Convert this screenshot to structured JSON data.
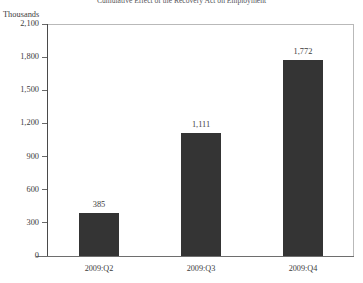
{
  "chart_data": {
    "type": "bar",
    "title": "Cumulative Effect of the Recovery Act on Employment",
    "categories": [
      "2009:Q2",
      "2009:Q3",
      "2009:Q4"
    ],
    "values": [
      385,
      1111,
      1772
    ],
    "value_labels": [
      "385",
      "1,111",
      "1,772"
    ],
    "xlabel": "",
    "ylabel": "Thousands",
    "ylim": [
      0,
      2100
    ],
    "yticks": [
      0,
      300,
      600,
      900,
      1200,
      1500,
      1800,
      2100
    ],
    "ytick_labels": [
      "0",
      "300",
      "600",
      "900",
      "1,200",
      "1,500",
      "1,800",
      "2,100"
    ],
    "grid": false,
    "legend": null,
    "series": [
      {
        "name": "Cumulative employment effect",
        "values": [
          385,
          1111,
          1772
        ],
        "color": "#343434"
      }
    ]
  },
  "style": {
    "bar_color": "#343434",
    "axis_color": "#4a4a4a",
    "frame_color": "#b9b9b9",
    "text_color": "#3c3c3c",
    "background": "#ffffff"
  }
}
